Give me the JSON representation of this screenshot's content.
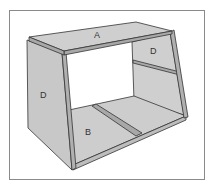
{
  "diagram": {
    "type": "exploded cabinet / box illustration",
    "labels": {
      "top_panel": "A",
      "right_side_panel": "D",
      "left_side_panel": "D",
      "bottom_panel": "B"
    },
    "colors": {
      "panel_fill": "#c8c8c8",
      "panel_edge": "#333333",
      "frame": "#8a8a8a",
      "background": "#ffffff"
    }
  }
}
